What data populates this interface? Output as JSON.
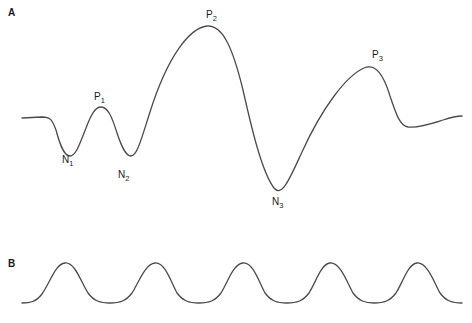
{
  "figure": {
    "width": 472,
    "height": 323,
    "background_color": "#ffffff",
    "trace_color": "#4a4a4a",
    "label_color": "#1a1a1a"
  },
  "panels": [
    {
      "letter": "A",
      "description": "Irregular evoked-potential-like waveform with three positive peaks and three negative troughs"
    },
    {
      "letter": "B",
      "description": "Regular periodic sinusoid-like waveform with five crests"
    }
  ],
  "annotations": [
    {
      "id": "n1",
      "base": "N",
      "sub": "1",
      "x": 62,
      "y": 155
    },
    {
      "id": "p1",
      "base": "P",
      "sub": "1",
      "x": 94,
      "y": 92
    },
    {
      "id": "n2",
      "base": "N",
      "sub": "2",
      "x": 118,
      "y": 170
    },
    {
      "id": "p2",
      "base": "P",
      "sub": "2",
      "x": 206,
      "y": 10
    },
    {
      "id": "n3",
      "base": "N",
      "sub": "3",
      "x": 272,
      "y": 197
    },
    {
      "id": "p3",
      "base": "P",
      "sub": "3",
      "x": 372,
      "y": 50
    }
  ],
  "chart_data": {
    "type": "line",
    "title": "",
    "xlabel": "",
    "ylabel": "",
    "grid": false,
    "legend": "none",
    "axis_visible": false,
    "series": [
      {
        "name": "A",
        "panel": "A",
        "baseline_y": 118,
        "x_range": [
          22,
          462
        ],
        "y_range": [
          25,
          190
        ],
        "path": "M 22,118 L 42,117 C 50,117 52,119 56,130 C 60,145 64,156 70,156 C 76,156 80,143 86,128 C 91,115 95,107 101,107 C 108,107 112,117 117,133 C 122,148 126,156 131,156 C 137,156 141,140 150,112 C 168,55 190,28 207,26 C 222,25 232,45 243,90 C 252,130 262,172 274,188 C 282,198 290,178 302,152 C 322,108 346,76 364,68 C 376,63 384,76 390,96 C 396,114 400,126 408,127 C 418,128 430,124 443,120 C 452,117 458,116 462,116",
        "features": [
          {
            "label": "N1",
            "kind": "trough",
            "x": 70,
            "y": 156
          },
          {
            "label": "P1",
            "kind": "peak",
            "x": 101,
            "y": 107
          },
          {
            "label": "N2",
            "kind": "trough",
            "x": 131,
            "y": 156
          },
          {
            "label": "P2",
            "kind": "peak",
            "x": 207,
            "y": 26
          },
          {
            "label": "N3",
            "kind": "trough",
            "x": 274,
            "y": 188
          },
          {
            "label": "P3",
            "kind": "peak",
            "x": 364,
            "y": 68
          }
        ]
      },
      {
        "name": "B",
        "panel": "B",
        "baseline_y": 303,
        "x_range": [
          22,
          462
        ],
        "y_range": [
          263,
          303
        ],
        "crest_y": 263,
        "trough_y": 303,
        "period": 88,
        "crest_x": [
          65,
          155,
          243,
          330,
          417
        ],
        "trough_x": [
          110,
          199,
          287,
          374,
          460
        ],
        "path": "M 22,303 C 30,303 36,302 42,294 C 50,283 55,264 65,263 C 75,262 81,282 88,293 C 94,301 100,303 110,303 C 120,303 126,301 132,293 C 139,282 145,264 155,263 C 165,262 171,282 177,293 C 183,301 189,303 199,303 C 209,303 215,301 221,293 C 228,282 233,264 243,263 C 253,262 259,282 265,293 C 271,301 277,303 287,303 C 297,303 303,301 309,293 C 316,282 321,264 330,263 C 340,262 347,282 353,293 C 359,301 365,303 374,303 C 384,303 390,301 396,293 C 403,282 408,264 417,263 C 427,262 434,282 440,293 C 446,301 452,303 462,303"
      }
    ]
  }
}
